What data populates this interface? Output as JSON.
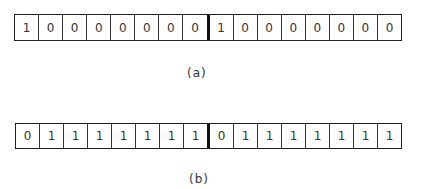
{
  "figure": {
    "rows": [
      {
        "caption": "(a)",
        "bits": [
          "1",
          "0",
          "0",
          "0",
          "0",
          "0",
          "0",
          "0",
          "1",
          "0",
          "0",
          "0",
          "0",
          "0",
          "0",
          "0"
        ]
      },
      {
        "caption": "(b)",
        "bits": [
          "0",
          "1",
          "1",
          "1",
          "1",
          "1",
          "1",
          "1",
          "0",
          "1",
          "1",
          "1",
          "1",
          "1",
          "1",
          "1"
        ]
      }
    ],
    "byte_boundary_after_cell": 8
  }
}
